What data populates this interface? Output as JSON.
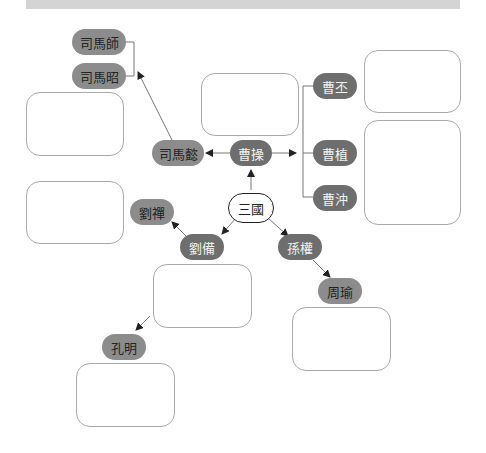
{
  "colors": {
    "dark_node": "#6e6e6e",
    "light_node": "#8c8c8c",
    "line": "#666666",
    "box_border": "#aaaaaa",
    "top_bar": "#d4d4d4"
  },
  "root": {
    "label": "三國"
  },
  "nodes": {
    "cao_cao": "曹操",
    "sima_yi": "司馬懿",
    "sima_shi": "司馬師",
    "sima_zhao": "司馬昭",
    "cao_pi": "曹丕",
    "cao_zhi": "曹植",
    "cao_chong": "曹沖",
    "liu_bei": "劉備",
    "liu_shan": "劉禪",
    "kong_ming": "孔明",
    "sun_quan": "孫權",
    "zhou_yu": "周瑜"
  }
}
